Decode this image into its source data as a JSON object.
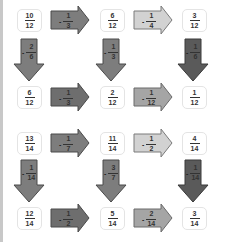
{
  "colors": {
    "dark": "#5a5a5a",
    "mid": "#7d7d7d",
    "light": "#bdbdbd",
    "stroke": "#4a4a4a",
    "edge": "#c8c8c8"
  },
  "blocks": [
    {
      "top": {
        "a": {
          "n": "10",
          "d": "12"
        },
        "op1": {
          "n": "1",
          "d": "3",
          "shade": "mid"
        },
        "b": {
          "n": "6",
          "d": "12"
        },
        "op2": {
          "n": "1",
          "d": "4",
          "shade": "light"
        },
        "c": {
          "n": "3",
          "d": "12"
        }
      },
      "down": [
        {
          "n": "2",
          "d": "6",
          "shade": "mid"
        },
        {
          "n": "1",
          "d": "3",
          "shade": "mid"
        },
        {
          "n": "1",
          "d": "6",
          "shade": "dark"
        }
      ],
      "bottom": {
        "a": {
          "n": "6",
          "d": "12"
        },
        "op1": {
          "n": "1",
          "d": "3",
          "shade": "mid"
        },
        "b": {
          "n": "2",
          "d": "12"
        },
        "op2": {
          "n": "1",
          "d": "12",
          "shade": "light"
        },
        "c": {
          "n": "1",
          "d": "12"
        }
      }
    },
    {
      "top": {
        "a": {
          "n": "13",
          "d": "14"
        },
        "op1": {
          "n": "1",
          "d": "7",
          "shade": "mid"
        },
        "b": {
          "n": "11",
          "d": "14"
        },
        "op2": {
          "n": "1",
          "d": "2",
          "shade": "light"
        },
        "c": {
          "n": "4",
          "d": "14"
        }
      },
      "down": [
        {
          "n": "1",
          "d": "14",
          "shade": "mid"
        },
        {
          "n": "3",
          "d": "7",
          "shade": "mid"
        },
        {
          "n": "1",
          "d": "14",
          "shade": "dark"
        }
      ],
      "bottom": {
        "a": {
          "n": "12",
          "d": "14"
        },
        "op1": {
          "n": "1",
          "d": "2",
          "shade": "mid"
        },
        "b": {
          "n": "5",
          "d": "14"
        },
        "op2": {
          "n": "2",
          "d": "14",
          "shade": "light"
        },
        "c": {
          "n": "3",
          "d": "14"
        }
      }
    }
  ],
  "minus_sign": "-"
}
